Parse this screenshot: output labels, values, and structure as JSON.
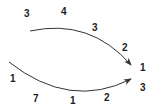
{
  "diagram": {
    "colors": {
      "stroke": "#333333",
      "text": "#222222",
      "background": "#ffffff"
    },
    "arrows": [
      {
        "name": "upper-arrow",
        "from": [
          30,
          31
        ],
        "control": [
          90,
          18
        ],
        "to": [
          131,
          65
        ]
      },
      {
        "name": "lower-arrow",
        "from": [
          9,
          62
        ],
        "control": [
          70,
          110
        ],
        "to": [
          131,
          79
        ]
      }
    ],
    "labels": [
      {
        "id": "top-left-3",
        "text": "3",
        "x": 24,
        "y": 9
      },
      {
        "id": "top-mid-4",
        "text": "4",
        "x": 61,
        "y": 7
      },
      {
        "id": "upper-mid-3",
        "text": "3",
        "x": 92,
        "y": 23
      },
      {
        "id": "upper-right-2",
        "text": "2",
        "x": 122,
        "y": 43
      },
      {
        "id": "right-1",
        "text": "1",
        "x": 140,
        "y": 63
      },
      {
        "id": "right-3",
        "text": "3",
        "x": 140,
        "y": 83
      },
      {
        "id": "left-1",
        "text": "1",
        "x": 10,
        "y": 74
      },
      {
        "id": "bottom-7",
        "text": "7",
        "x": 33,
        "y": 94
      },
      {
        "id": "bottom-1",
        "text": "1",
        "x": 70,
        "y": 96
      },
      {
        "id": "bottom-2",
        "text": "2",
        "x": 104,
        "y": 93
      }
    ]
  }
}
